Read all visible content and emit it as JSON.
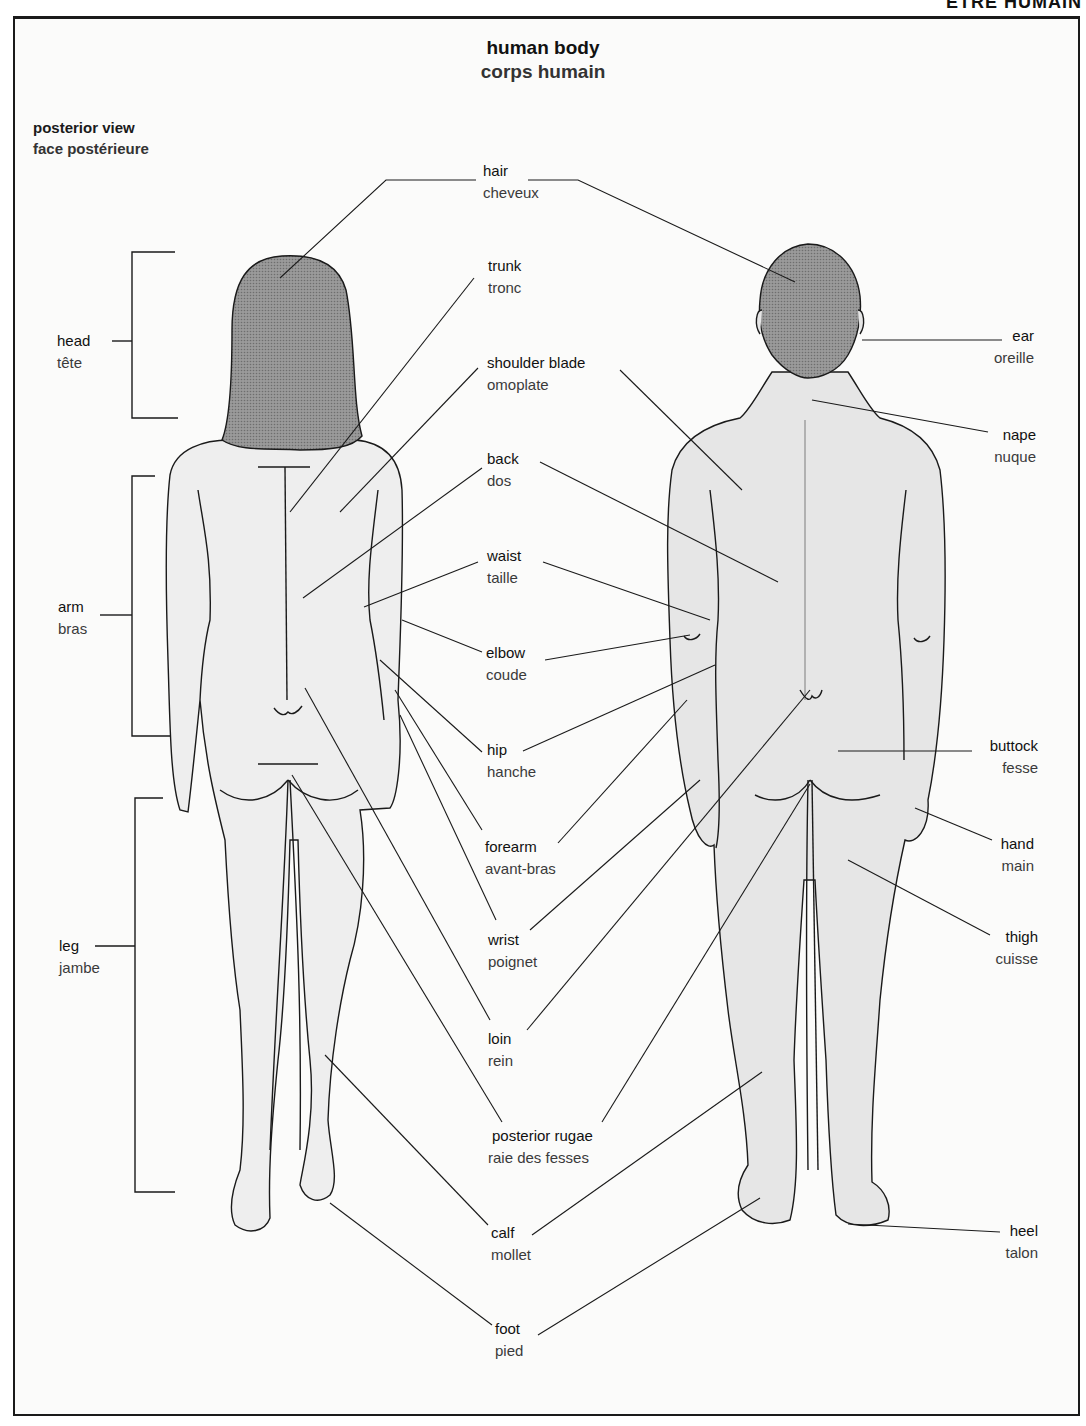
{
  "running_head": "ÊTRE HUMAIN",
  "title": {
    "en": "human body",
    "fr": "corps humain"
  },
  "view": {
    "en": "posterior view",
    "fr": "face postérieure"
  },
  "colors": {
    "ink": "#1a1a1a",
    "skin": "#ececec",
    "hair": "#8c8c8c",
    "paper": "#fbfbfa"
  },
  "labels": {
    "hair": {
      "en": "hair",
      "fr": "cheveux"
    },
    "trunk": {
      "en": "trunk",
      "fr": "tronc"
    },
    "shoulder_blade": {
      "en": "shoulder blade",
      "fr": "omoplate"
    },
    "back": {
      "en": "back",
      "fr": "dos"
    },
    "waist": {
      "en": "waist",
      "fr": "taille"
    },
    "elbow": {
      "en": "elbow",
      "fr": "coude"
    },
    "hip": {
      "en": "hip",
      "fr": "hanche"
    },
    "forearm": {
      "en": "forearm",
      "fr": "avant-bras"
    },
    "wrist": {
      "en": "wrist",
      "fr": "poignet"
    },
    "loin": {
      "en": "loin",
      "fr": "rein"
    },
    "posterior_rugae": {
      "en": "posterior rugae",
      "fr": "raie des fesses"
    },
    "calf": {
      "en": "calf",
      "fr": "mollet"
    },
    "foot": {
      "en": "foot",
      "fr": "pied"
    },
    "head": {
      "en": "head",
      "fr": "tête"
    },
    "arm": {
      "en": "arm",
      "fr": "bras"
    },
    "leg": {
      "en": "leg",
      "fr": "jambe"
    },
    "ear": {
      "en": "ear",
      "fr": "oreille"
    },
    "nape": {
      "en": "nape",
      "fr": "nuque"
    },
    "buttock": {
      "en": "buttock",
      "fr": "fesse"
    },
    "hand": {
      "en": "hand",
      "fr": "main"
    },
    "thigh": {
      "en": "thigh",
      "fr": "cuisse"
    },
    "heel": {
      "en": "heel",
      "fr": "talon"
    }
  }
}
